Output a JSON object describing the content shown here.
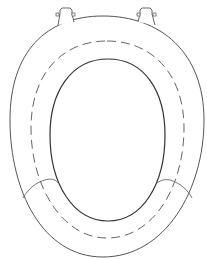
{
  "diagram": {
    "colors": {
      "background": "#ffffff",
      "stroke": "#444444",
      "stroke_light": "#777777"
    },
    "parts": [
      {
        "id": "left-hinge",
        "label": ""
      },
      {
        "id": "right-hinge",
        "label": ""
      },
      {
        "id": "outer-rim",
        "label": ""
      },
      {
        "id": "dashed-guide",
        "label": ""
      },
      {
        "id": "inner-opening",
        "label": ""
      },
      {
        "id": "left-seam",
        "label": ""
      },
      {
        "id": "right-seam",
        "label": ""
      }
    ]
  }
}
